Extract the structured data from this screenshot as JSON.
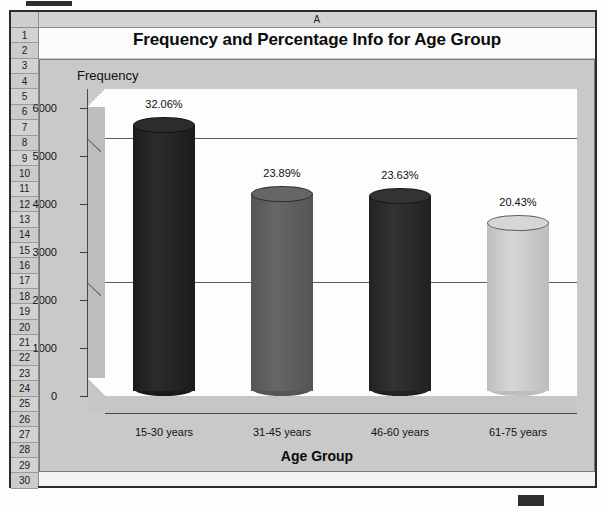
{
  "spreadsheet": {
    "column_headers": [
      "A"
    ],
    "row_numbers": [
      "1",
      "2",
      "3",
      "4",
      "5",
      "6",
      "7",
      "8",
      "9",
      "10",
      "11",
      "12",
      "13",
      "14",
      "15",
      "16",
      "17",
      "18",
      "19",
      "20",
      "21",
      "22",
      "23",
      "24",
      "25",
      "26",
      "27",
      "28",
      "29",
      "30"
    ],
    "title_cell": "Frequency and Percentage Info for Age Group"
  },
  "chart_data": {
    "type": "bar",
    "title": "Frequency and Percentage Info for Age Group",
    "xlabel": "Age Group",
    "ylabel": "Frequency",
    "categories": [
      "15-30 years",
      "31-45 years",
      "46-60 years",
      "61-75 years"
    ],
    "values": [
      5650,
      4210,
      4165,
      3600
    ],
    "data_labels": [
      "32.06%",
      "23.89%",
      "23.63%",
      "20.43%"
    ],
    "yticks": [
      0,
      1000,
      2000,
      3000,
      4000,
      5000,
      6000
    ],
    "ytick_labels": [
      "0",
      "1000",
      "2000",
      "3000",
      "4000",
      "5000",
      "6000"
    ],
    "ylim": [
      0,
      6400
    ],
    "grid": true,
    "legend": "none",
    "style": "3d-cylinder",
    "bar_colors": [
      "#1b1b1b",
      "#555555",
      "#222222",
      "#bdbdbd"
    ],
    "bar_top_colors": [
      "#2c2c2c",
      "#666666",
      "#333333",
      "#d6d6d6"
    ]
  },
  "colors": {
    "chart_background": "#c9c9c9",
    "plot_background": "#fdfdfd",
    "sheet_background": "#f4f4f4",
    "header_background": "#cfcfcf",
    "gridline": "#5b5b5b",
    "text": "#101010"
  }
}
